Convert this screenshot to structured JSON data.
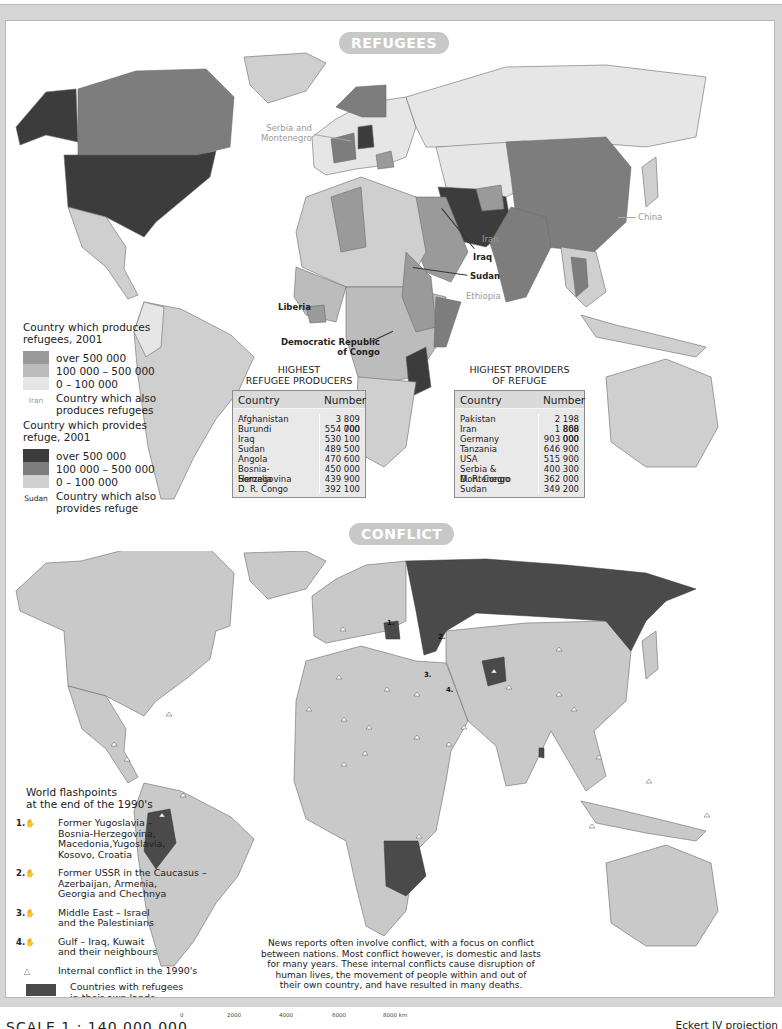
{
  "refugees_section": {
    "title": "REFUGEES",
    "map_labels": {
      "serbia": "Serbia and\nMontenegro",
      "serbia_line1": "Serbia and",
      "serbia_line2": "Montenegro",
      "china": "China",
      "iran": "Iran",
      "iraq": "Iraq",
      "sudan": "Sudan",
      "ethiopia": "Ethiopia",
      "liberia": "Liberia",
      "drc_line1": "Democratic Republic",
      "drc_line2": "of Congo"
    },
    "legend_producers": {
      "title_line1": "Country which produces",
      "title_line2": "refugees, 2001",
      "items": [
        {
          "label": "over 500 000",
          "color": "#9a9a9a"
        },
        {
          "label": "100 000 – 500 000",
          "color": "#bcbcbc"
        },
        {
          "label": "0 – 100 000",
          "color": "#e6e6e6"
        }
      ],
      "note_tag": "Iran",
      "note_line1": "Country which also",
      "note_line2": "produces refugees"
    },
    "legend_providers": {
      "title_line1": "Country which provides",
      "title_line2": "refuge, 2001",
      "items": [
        {
          "label": "over 500 000",
          "color": "#3c3c3c"
        },
        {
          "label": "100 000 – 500 000",
          "color": "#7d7d7d"
        },
        {
          "label": "0 – 100 000",
          "color": "#cfcfcf"
        }
      ],
      "note_tag": "Sudan",
      "note_line1": "Country which also",
      "note_line2": "provides refuge"
    },
    "producers_table": {
      "title_line1": "HIGHEST",
      "title_line2": "REFUGEE PRODUCERS",
      "headers": [
        "Country",
        "Number"
      ],
      "rows": [
        [
          "Afghanistan",
          "3 809 700"
        ],
        [
          "Burundi",
          "554 000"
        ],
        [
          "Iraq",
          "530 100"
        ],
        [
          "Sudan",
          "489 500"
        ],
        [
          "Angola",
          "470 600"
        ],
        [
          "Bosnia-Herzegovina",
          "450 000"
        ],
        [
          "Somalia",
          "439 900"
        ],
        [
          "D. R. Congo",
          "392 100"
        ]
      ]
    },
    "providers_table": {
      "title_line1": "HIGHEST PROVIDERS",
      "title_line2": "OF REFUGE",
      "headers": [
        "Country",
        "Number"
      ],
      "rows": [
        [
          "Pakistan",
          "2 198 800"
        ],
        [
          "Iran",
          "1 868 000"
        ],
        [
          "Germany",
          "903 000"
        ],
        [
          "Tanzania",
          "646 900"
        ],
        [
          "USA",
          "515 900"
        ],
        [
          "Serbia & Montenegro",
          "400 300"
        ],
        [
          "D. R. Congo",
          "362 000"
        ],
        [
          "Sudan",
          "349 200"
        ]
      ]
    }
  },
  "conflict_section": {
    "title": "CONFLICT",
    "map_numbers": [
      "1.",
      "2.",
      "3.",
      "4."
    ],
    "legend": {
      "title_line1": "World flashpoints",
      "title_line2": "at the end of the 1990's",
      "items": [
        {
          "num": "1.",
          "lines": [
            "Former Yugoslavia –",
            "Bosnia-Herzegovina,",
            "Macedonia,Yugoslavia,",
            "Kosovo, Croatia"
          ]
        },
        {
          "num": "2.",
          "lines": [
            "Former USSR in the Caucasus –",
            "Azerbaijan, Armenia,",
            "Georgia and Chechnya"
          ]
        },
        {
          "num": "3.",
          "lines": [
            "Middle East – Israel",
            "and the Palestinians"
          ]
        },
        {
          "num": "4.",
          "lines": [
            "Gulf – Iraq, Kuwait",
            "and their neighbours"
          ]
        }
      ],
      "internal_conflict": "Internal conflict in the 1990's",
      "refugees_own_lands_line1": "Countries with refugees",
      "refugees_own_lands_line2": "in their own lands",
      "refugees_own_lands_color": "#4a4a4a"
    },
    "caption_lines": [
      "News reports often involve conflict, with a focus on conflict",
      "between nations. Most conflict  however, is domestic and lasts",
      "for many years. These internal conflicts cause disruption of",
      "human lives, the movement of people within and out of",
      "their own country, and have resulted in many deaths."
    ]
  },
  "footer": {
    "scale": "SCALE 1 : 140 000 000",
    "scale_ticks": [
      "0",
      "2000",
      "4000",
      "6000",
      "8000 km"
    ],
    "projection": "Eckert IV projection"
  },
  "colors": {
    "frame": "#d6d6d6",
    "pill": "#c8c8c8",
    "land_conflict": "#c9c9c9",
    "refugees_own_lands": "#4a4a4a",
    "ocean": "#ffffff"
  }
}
